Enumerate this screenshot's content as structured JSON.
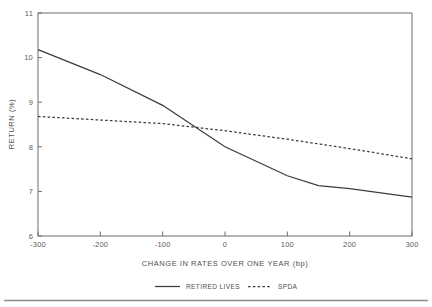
{
  "chart_data": {
    "type": "line",
    "title": "",
    "xlabel": "CHANGE IN RATES OVER ONE YEAR (bp)",
    "ylabel": "RETURN (%)",
    "xlim": [
      -300,
      300
    ],
    "ylim": [
      6,
      11
    ],
    "xticks": [
      -300,
      -200,
      -100,
      0,
      100,
      200,
      300
    ],
    "xtick_labels": [
      "-300",
      "-200",
      "-100",
      "0",
      "100",
      "200",
      "300"
    ],
    "yticks": [
      6,
      7,
      8,
      9,
      10,
      11
    ],
    "ytick_labels": [
      "6",
      "7",
      "8",
      "9",
      "10",
      "11"
    ],
    "grid": false,
    "legend_position": "below-outside",
    "series": [
      {
        "name": "RETIRED LIVES",
        "style": "solid",
        "color": "#3c3c3c",
        "x": [
          -300,
          -200,
          -100,
          0,
          100,
          150,
          200,
          300
        ],
        "values": [
          10.18,
          9.62,
          8.93,
          8.0,
          7.35,
          7.13,
          7.06,
          6.87
        ]
      },
      {
        "name": "SPDA",
        "style": "dashed",
        "color": "#3c3c3c",
        "x": [
          -300,
          -200,
          -100,
          0,
          100,
          200,
          300
        ],
        "values": [
          8.68,
          8.6,
          8.52,
          8.36,
          8.17,
          7.96,
          7.73
        ]
      }
    ],
    "annotations": []
  },
  "legend": {
    "items": [
      {
        "label": "RETIRED LIVES",
        "style": "solid"
      },
      {
        "label": "SPDA",
        "style": "dashed"
      }
    ]
  }
}
